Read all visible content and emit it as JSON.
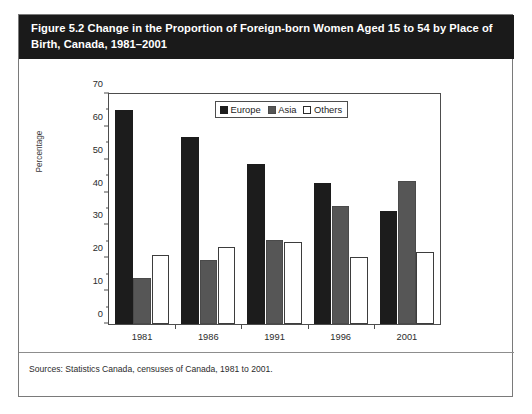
{
  "figure": {
    "title": "Figure 5.2 Change in the Proportion of Foreign-born Women Aged 15 to 54 by Place of\nBirth, Canada, 1981–2001",
    "source": "Sources: Statistics Canada, censuses of Canada, 1981 to 2001."
  },
  "legend": {
    "europe": "Europe",
    "asia": "Asia",
    "others": "Others"
  },
  "axis": {
    "y_title": "Percentage",
    "y_ticks": [
      "0",
      "10",
      "20",
      "30",
      "40",
      "50",
      "60",
      "70"
    ],
    "x_ticks": [
      "1981",
      "1986",
      "1991",
      "1996",
      "2001"
    ]
  },
  "colors": {
    "europe": "#1c1c1c",
    "asia": "#565656",
    "others": "#ffffff",
    "title_bar": "#1a1a1a",
    "frame": "#4d4d4d"
  },
  "chart_data": {
    "type": "bar",
    "title": "Figure 5.2 Change in the Proportion of Foreign-born Women Aged 15 to 54 by Place of Birth, Canada, 1981–2001",
    "xlabel": "",
    "ylabel": "Percentage",
    "ylim": [
      0,
      70
    ],
    "ytick_step": 10,
    "yminor_step": 5,
    "grid": false,
    "legend_position": "top-center-inside",
    "categories": [
      "1981",
      "1986",
      "1991",
      "1996",
      "2001"
    ],
    "series": [
      {
        "name": "Europe",
        "color": "#1c1c1c",
        "values": [
          65.0,
          57.0,
          48.7,
          42.8,
          34.5
        ]
      },
      {
        "name": "Asia",
        "color": "#565656",
        "values": [
          14.0,
          19.5,
          25.5,
          36.0,
          43.5
        ]
      },
      {
        "name": "Others",
        "color": "#ffffff",
        "values": [
          21.0,
          23.5,
          25.0,
          20.5,
          22.0
        ]
      }
    ]
  }
}
